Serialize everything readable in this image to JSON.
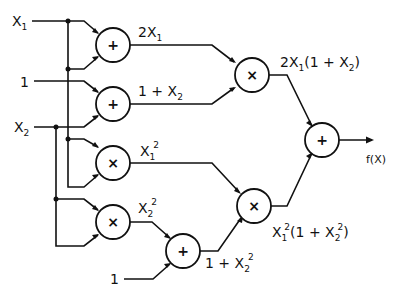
{
  "diagram": {
    "type": "computational-graph",
    "inputs": [
      {
        "id": "x1",
        "label": "X",
        "sub": "1"
      },
      {
        "id": "one_a",
        "label": "1"
      },
      {
        "id": "x2",
        "label": "X",
        "sub": "2"
      },
      {
        "id": "one_b",
        "label": "1"
      }
    ],
    "nodes": [
      {
        "id": "add1",
        "op": "+",
        "output_label": "2X₁"
      },
      {
        "id": "add2",
        "op": "+",
        "output_label": "1 + X₂"
      },
      {
        "id": "mul1",
        "op": "×",
        "output_label": "X₁²"
      },
      {
        "id": "mul2",
        "op": "×",
        "output_label": "X₂²"
      },
      {
        "id": "add3",
        "op": "+",
        "output_label": "1 + X₂²"
      },
      {
        "id": "mul3",
        "op": "×",
        "output_label": "2X₁(1 + X₂)"
      },
      {
        "id": "mul4",
        "op": "×",
        "output_label": "X₁²(1 + X₂²)"
      },
      {
        "id": "add4",
        "op": "+",
        "output_label": "f(X)"
      }
    ],
    "labels": {
      "x1": "X",
      "x1_sub": "1",
      "one_a": "1",
      "x2": "X",
      "x2_sub": "2",
      "one_b": "1",
      "add_op": "+",
      "mul_op": "×",
      "out_add1_a": "2X",
      "out_add1_sub": "1",
      "out_add2_a": "1 + X",
      "out_add2_sub": "2",
      "out_mul1_a": "X",
      "out_mul1_sub": "1",
      "out_mul1_sup": "2",
      "out_mul2_a": "X",
      "out_mul2_sub": "2",
      "out_mul2_sup": "2",
      "out_add3_a": "1 + X",
      "out_add3_sub": "2",
      "out_add3_sup": "2",
      "out_mul3_a": "2X",
      "out_mul3_sub1": "1",
      "out_mul3_b": "(1 + X",
      "out_mul3_sub2": "2",
      "out_mul3_c": ")",
      "out_mul4_a": "X",
      "out_mul4_sub1": "1",
      "out_mul4_sup1": "2",
      "out_mul4_b": "(1 + X",
      "out_mul4_sub2": "2",
      "out_mul4_sup2": "2",
      "out_mul4_c": ")",
      "output": "f(X)"
    }
  }
}
